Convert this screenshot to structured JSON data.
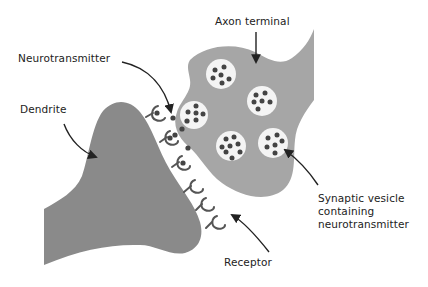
{
  "diagram": {
    "colors": {
      "background": "#ffffff",
      "axon_fill": "#a6a6a6",
      "dendrite_fill": "#8a8a8a",
      "vesicle_fill": "#f4f4f4",
      "dot": "#444444",
      "receptor": "#555555",
      "arrow": "#222222",
      "text": "#222222"
    },
    "labels": {
      "neurotransmitter": "Neurotransmitter",
      "dendrite": "Dendrite",
      "axon_terminal": "Axon terminal",
      "synaptic_vesicle_line1": "Synaptic vesicle",
      "synaptic_vesicle_line2": "containing",
      "synaptic_vesicle_line3": "neurotransmitter",
      "receptor": "Receptor"
    },
    "components": [
      {
        "name": "Axon terminal",
        "count": 1
      },
      {
        "name": "Dendrite",
        "count": 1
      },
      {
        "name": "Synaptic vesicle",
        "count": 6
      },
      {
        "name": "Receptor",
        "count": 6
      },
      {
        "name": "Free neurotransmitter",
        "count": 6
      }
    ]
  }
}
